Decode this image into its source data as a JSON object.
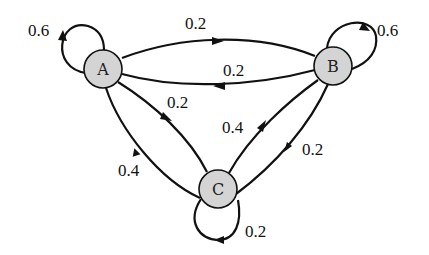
{
  "diagram": {
    "type": "markov-chain-state-diagram",
    "node_fill": "#d4d4d4",
    "stroke_color": "#111111",
    "nodes": [
      {
        "id": "A",
        "label": "A",
        "cx": 103,
        "cy": 69
      },
      {
        "id": "B",
        "label": "B",
        "cx": 333,
        "cy": 66
      },
      {
        "id": "C",
        "label": "C",
        "cx": 218,
        "cy": 189
      }
    ],
    "edges": [
      {
        "from": "A",
        "to": "A",
        "label": "0.6"
      },
      {
        "from": "A",
        "to": "B",
        "label": "0.2"
      },
      {
        "from": "B",
        "to": "A",
        "label": "0.2"
      },
      {
        "from": "B",
        "to": "B",
        "label": "0.6"
      },
      {
        "from": "A",
        "to": "C",
        "label": "0.2"
      },
      {
        "from": "C",
        "to": "A",
        "label": "0.4"
      },
      {
        "from": "C",
        "to": "B",
        "label": "0.4"
      },
      {
        "from": "B",
        "to": "C",
        "label": "0.2"
      },
      {
        "from": "C",
        "to": "C",
        "label": "0.2"
      }
    ]
  }
}
